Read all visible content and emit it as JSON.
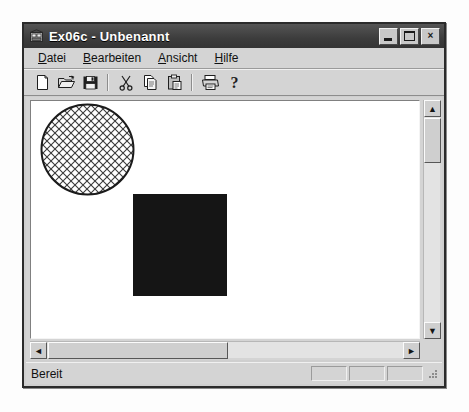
{
  "window": {
    "title": "Ex06c - Unbenannt",
    "app_icon": "mfc-app-icon",
    "caption_buttons": [
      {
        "name": "minimize-button",
        "icon": "minimize-icon",
        "label": ""
      },
      {
        "name": "maximize-button",
        "icon": "maximize-icon",
        "label": ""
      },
      {
        "name": "close-button",
        "icon": "close-icon",
        "label": "×"
      }
    ]
  },
  "menu": {
    "items": [
      {
        "label": "Datei",
        "mnemonic": "D",
        "rest": "atei"
      },
      {
        "label": "Bearbeiten",
        "mnemonic": "B",
        "rest": "earbeiten"
      },
      {
        "label": "Ansicht",
        "mnemonic": "A",
        "rest": "nsicht"
      },
      {
        "label": "Hilfe",
        "mnemonic": "H",
        "rest": "ilfe"
      }
    ]
  },
  "toolbar": {
    "buttons": [
      {
        "name": "new-button",
        "icon": "new-document-icon"
      },
      {
        "name": "open-button",
        "icon": "open-folder-icon"
      },
      {
        "name": "save-button",
        "icon": "floppy-save-icon"
      },
      {
        "name": "separator-1",
        "icon": "separator"
      },
      {
        "name": "cut-button",
        "icon": "scissors-icon"
      },
      {
        "name": "copy-button",
        "icon": "copy-icon"
      },
      {
        "name": "paste-button",
        "icon": "clipboard-paste-icon"
      },
      {
        "name": "separator-2",
        "icon": "separator"
      },
      {
        "name": "print-button",
        "icon": "printer-icon"
      },
      {
        "name": "help-button",
        "icon": "question-mark-icon"
      }
    ]
  },
  "canvas": {
    "background": "#ffffff",
    "shapes": [
      {
        "name": "hatched-circle",
        "type": "ellipse",
        "x": 10,
        "y": 3,
        "width": 93,
        "height": 91,
        "fill": "diagonal-cross-hatch",
        "fill_color": "#3a3a3a",
        "outline_color": "#1b1b1b"
      },
      {
        "name": "black-square",
        "type": "rect",
        "x": 102,
        "y": 93,
        "width": 94,
        "height": 102,
        "fill": "solid",
        "fill_color": "#151515",
        "outline_color": "#151515"
      }
    ]
  },
  "scrollbars": {
    "vertical": {
      "up_arrow": "▲",
      "down_arrow": "▼",
      "thumb_top": 18,
      "thumb_height": 45
    },
    "horizontal": {
      "left_arrow": "◄",
      "right_arrow": "►",
      "thumb_left": 18,
      "thumb_width": 180
    }
  },
  "status_bar": {
    "text": "Bereit",
    "panes": [
      "",
      "",
      ""
    ],
    "grip": "size-grip"
  },
  "colors": {
    "face": "#d4d4d4",
    "title_bar": "#3c3c3c",
    "title_text": "#ffffff",
    "client": "#ffffff",
    "shape_black": "#151515"
  }
}
